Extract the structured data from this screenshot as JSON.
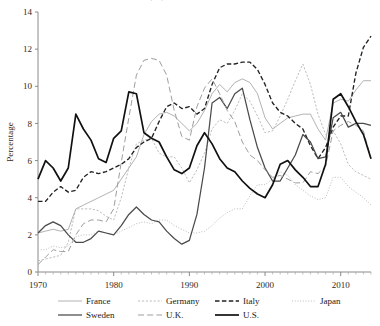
{
  "chart_data": {
    "type": "line",
    "title": "",
    "xlabel": "",
    "ylabel": "Percentage",
    "xlim": [
      1970,
      2014
    ],
    "ylim": [
      0,
      14
    ],
    "ytick_step": 2,
    "yticks": [
      0,
      2,
      4,
      6,
      8,
      10,
      12,
      14
    ],
    "xticks": [
      1970,
      1980,
      1990,
      2000,
      2010
    ],
    "xtick_labels": [
      "1970",
      "1980",
      "1990",
      "2000",
      "2010"
    ],
    "ytick_labels": [
      "0",
      "2",
      "4",
      "6",
      "8",
      "10",
      "12",
      "14"
    ],
    "minor_ticks": "every year",
    "grid": false,
    "legend_position": "bottom",
    "x": [
      1970,
      1971,
      1972,
      1973,
      1974,
      1975,
      1976,
      1977,
      1978,
      1979,
      1980,
      1981,
      1982,
      1983,
      1984,
      1985,
      1986,
      1987,
      1988,
      1989,
      1990,
      1991,
      1992,
      1993,
      1994,
      1995,
      1996,
      1997,
      1998,
      1999,
      2000,
      2001,
      2002,
      2003,
      2004,
      2005,
      2006,
      2007,
      2008,
      2009,
      2010,
      2011,
      2012,
      2013,
      2014
    ],
    "series": [
      {
        "name": "France",
        "color": "#a9a9a9",
        "style": "solid-thin",
        "values": [
          2.1,
          2.2,
          2.3,
          2.2,
          2.3,
          3.4,
          3.6,
          3.8,
          4.0,
          4.2,
          4.4,
          5.0,
          5.6,
          6.2,
          7.4,
          8.1,
          8.5,
          8.6,
          8.4,
          8.0,
          7.6,
          8.0,
          8.7,
          9.6,
          10.1,
          9.7,
          10.2,
          10.4,
          10.2,
          9.6,
          8.3,
          7.7,
          8.0,
          8.3,
          8.4,
          8.5,
          8.5,
          7.7,
          7.1,
          9.1,
          9.3,
          9.2,
          9.8,
          10.3,
          10.3
        ]
      },
      {
        "name": "Germany",
        "color": "#b5b5b5",
        "style": "fine-dash",
        "values": [
          0.6,
          0.7,
          0.8,
          0.9,
          1.6,
          3.4,
          3.4,
          3.4,
          3.3,
          3.0,
          2.8,
          4.0,
          5.6,
          6.9,
          7.1,
          7.2,
          6.4,
          6.2,
          6.2,
          5.6,
          4.8,
          5.5,
          6.4,
          7.7,
          8.2,
          8.0,
          8.7,
          9.6,
          9.2,
          8.4,
          7.5,
          7.6,
          8.4,
          9.3,
          10.3,
          11.2,
          10.1,
          8.5,
          7.4,
          7.6,
          6.9,
          5.8,
          5.4,
          5.2,
          5.0
        ]
      },
      {
        "name": "Italy",
        "color": "#222222",
        "style": "dashed",
        "values": [
          3.8,
          3.8,
          4.3,
          4.6,
          4.3,
          4.4,
          5.1,
          5.4,
          5.3,
          5.4,
          5.6,
          5.8,
          6.1,
          6.7,
          7.0,
          7.2,
          8.1,
          8.9,
          9.1,
          8.8,
          8.9,
          8.5,
          8.8,
          10.1,
          11.0,
          11.2,
          11.2,
          11.3,
          11.3,
          10.9,
          10.1,
          9.1,
          8.6,
          8.4,
          8.0,
          7.7,
          6.8,
          6.1,
          6.7,
          7.8,
          8.4,
          8.4,
          10.7,
          12.1,
          12.7
        ]
      },
      {
        "name": "Japan",
        "color": "#bdbdbd",
        "style": "dotted",
        "values": [
          1.2,
          1.2,
          1.4,
          1.3,
          1.4,
          1.9,
          2.0,
          2.0,
          2.2,
          2.1,
          2.0,
          2.2,
          2.4,
          2.6,
          2.7,
          2.6,
          2.8,
          2.8,
          2.5,
          2.3,
          2.1,
          2.1,
          2.2,
          2.5,
          2.9,
          3.2,
          3.4,
          3.4,
          4.1,
          4.7,
          4.7,
          5.0,
          5.4,
          5.2,
          4.7,
          4.4,
          4.1,
          3.9,
          4.0,
          5.1,
          5.1,
          4.6,
          4.3,
          4.0,
          3.6
        ]
      },
      {
        "name": "Sweden",
        "color": "#4a4a4a",
        "style": "solid-medium",
        "values": [
          2.1,
          2.5,
          2.7,
          2.5,
          2.0,
          1.6,
          1.6,
          1.8,
          2.2,
          2.1,
          2.0,
          2.5,
          3.1,
          3.5,
          3.1,
          2.8,
          2.7,
          2.2,
          1.8,
          1.5,
          1.7,
          3.1,
          5.6,
          9.1,
          9.4,
          8.8,
          9.6,
          9.9,
          8.2,
          6.7,
          5.6,
          4.9,
          4.9,
          5.6,
          6.3,
          7.4,
          7.0,
          6.1,
          6.2,
          8.3,
          8.6,
          7.8,
          8.0,
          8.0,
          7.9
        ]
      },
      {
        "name": "U.K.",
        "color": "#9e9e9e",
        "style": "long-dash",
        "values": [
          0.4,
          0.8,
          1.2,
          1.1,
          1.1,
          2.0,
          2.6,
          2.8,
          2.8,
          2.7,
          3.4,
          5.9,
          8.3,
          10.6,
          11.4,
          11.5,
          11.4,
          10.6,
          8.7,
          7.3,
          7.1,
          8.9,
          9.9,
          10.4,
          9.6,
          8.7,
          8.1,
          7.0,
          6.3,
          6.0,
          5.5,
          5.1,
          5.2,
          5.0,
          4.8,
          4.8,
          5.4,
          5.3,
          5.7,
          7.6,
          7.9,
          8.1,
          7.9,
          7.6,
          6.1
        ]
      },
      {
        "name": "U.S.",
        "color": "#111111",
        "style": "solid-thick",
        "values": [
          5.0,
          6.0,
          5.6,
          4.9,
          5.6,
          8.5,
          7.7,
          7.1,
          6.1,
          5.9,
          7.2,
          7.6,
          9.7,
          9.6,
          7.5,
          7.2,
          7.0,
          6.2,
          5.5,
          5.3,
          5.6,
          6.8,
          7.5,
          6.9,
          6.1,
          5.6,
          5.4,
          4.9,
          4.5,
          4.2,
          4.0,
          4.7,
          5.8,
          6.0,
          5.5,
          5.1,
          4.6,
          4.6,
          5.8,
          9.3,
          9.6,
          8.9,
          8.1,
          7.4,
          6.1
        ]
      }
    ]
  },
  "legend": {
    "rows": [
      [
        {
          "label": "France",
          "key": "france"
        },
        {
          "label": "Germany",
          "key": "germany"
        },
        {
          "label": "Italy",
          "key": "italy"
        },
        {
          "label": "Japan",
          "key": "japan"
        }
      ],
      [
        {
          "label": "Sweden",
          "key": "sweden"
        },
        {
          "label": "U.K.",
          "key": "uk"
        },
        {
          "label": "U.S.",
          "key": "us"
        }
      ]
    ]
  }
}
